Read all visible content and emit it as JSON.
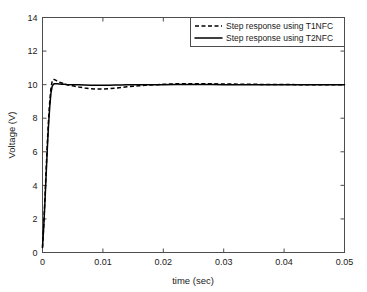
{
  "chart_data": {
    "type": "line",
    "title": "",
    "xlabel": "time (sec)",
    "ylabel": "Voltage (V)",
    "xlim": [
      0,
      0.05
    ],
    "ylim": [
      0,
      14
    ],
    "xticks": [
      "0",
      "0.01",
      "0.02",
      "0.03",
      "0.04",
      "0.05"
    ],
    "xtick_values": [
      0,
      0.01,
      0.02,
      0.03,
      0.04,
      0.05
    ],
    "yticks": [
      "0",
      "2",
      "4",
      "6",
      "8",
      "10",
      "12",
      "14"
    ],
    "ytick_values": [
      0,
      2,
      4,
      6,
      8,
      10,
      12,
      14
    ],
    "grid": false,
    "legend_position": "top-right",
    "series": [
      {
        "name": "Step response using T1NFC",
        "style": "dashed",
        "color": "#000000",
        "x": [
          0,
          0.0002,
          0.0004,
          0.0006,
          0.0008,
          0.001,
          0.0012,
          0.0014,
          0.0016,
          0.0018,
          0.002,
          0.0024,
          0.0028,
          0.0032,
          0.0036,
          0.004,
          0.005,
          0.006,
          0.007,
          0.008,
          0.009,
          0.01,
          0.011,
          0.012,
          0.013,
          0.014,
          0.015,
          0.016,
          0.017,
          0.018,
          0.019,
          0.02,
          0.022,
          0.024,
          0.026,
          0.028,
          0.03,
          0.034,
          0.038,
          0.042,
          0.046,
          0.05
        ],
        "y": [
          0.3,
          1.6,
          3.2,
          4.9,
          6.5,
          7.9,
          9.0,
          9.8,
          10.2,
          10.32,
          10.3,
          10.22,
          10.15,
          10.1,
          10.05,
          10.0,
          9.93,
          9.86,
          9.8,
          9.76,
          9.74,
          9.74,
          9.76,
          9.79,
          9.83,
          9.87,
          9.9,
          9.93,
          9.96,
          9.98,
          10.0,
          10.02,
          10.05,
          10.06,
          10.06,
          10.05,
          10.04,
          10.02,
          10.01,
          10.0,
          10.0,
          10.0
        ]
      },
      {
        "name": "Step response using T2NFC",
        "style": "solid",
        "color": "#000000",
        "x": [
          0,
          0.0002,
          0.0004,
          0.0006,
          0.0008,
          0.001,
          0.0012,
          0.0014,
          0.0016,
          0.0018,
          0.002,
          0.0024,
          0.0028,
          0.0032,
          0.0036,
          0.004,
          0.005,
          0.006,
          0.007,
          0.008,
          0.009,
          0.01,
          0.011,
          0.012,
          0.013,
          0.014,
          0.015,
          0.016,
          0.017,
          0.018,
          0.019,
          0.02,
          0.022,
          0.024,
          0.026,
          0.028,
          0.03,
          0.034,
          0.038,
          0.042,
          0.046,
          0.05
        ],
        "y": [
          0.3,
          1.5,
          3.0,
          4.6,
          6.2,
          7.6,
          8.7,
          9.5,
          9.9,
          10.02,
          10.05,
          10.05,
          10.04,
          10.03,
          10.02,
          10.01,
          10.0,
          9.99,
          9.98,
          9.97,
          9.97,
          9.97,
          9.97,
          9.98,
          9.98,
          9.99,
          9.99,
          10.0,
          10.0,
          10.0,
          10.0,
          10.0,
          10.01,
          10.01,
          10.01,
          10.01,
          10.0,
          10.0,
          10.0,
          10.0,
          10.0,
          10.0
        ]
      }
    ],
    "legend": [
      {
        "label": "Step response using T1NFC",
        "style": "dashed"
      },
      {
        "label": "Step response using T2NFC",
        "style": "solid"
      }
    ]
  }
}
